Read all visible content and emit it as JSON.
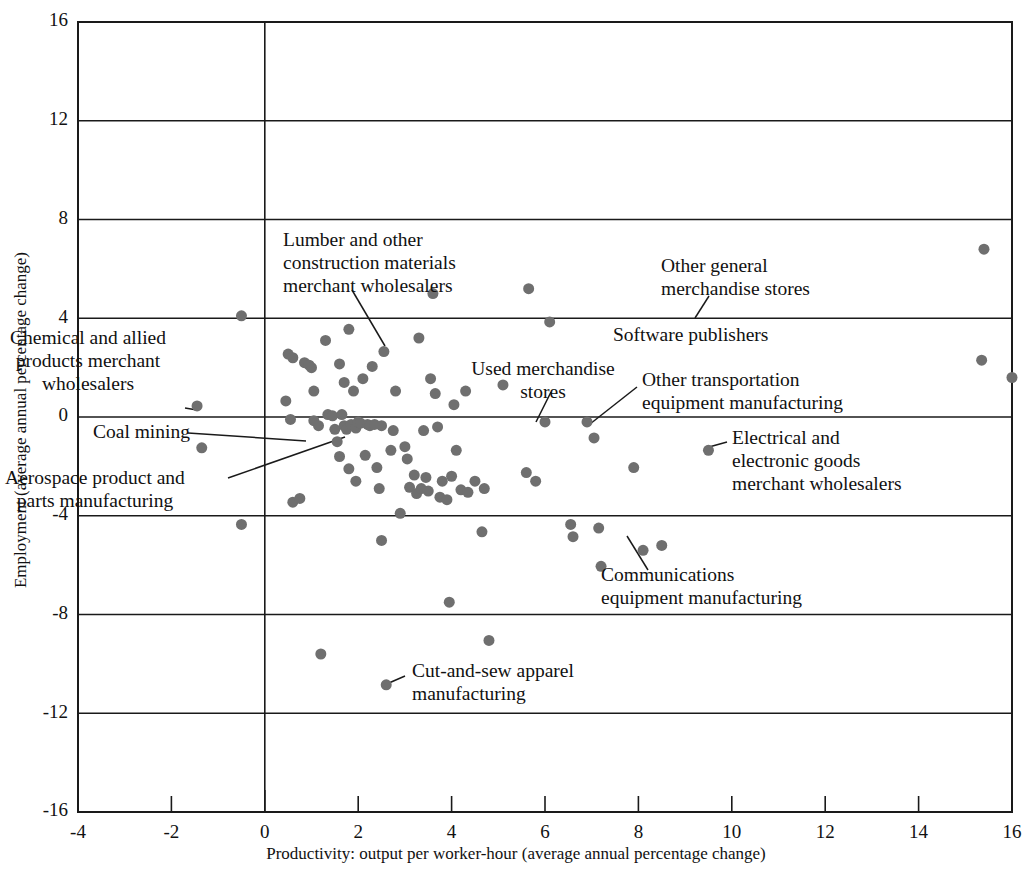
{
  "chart_data": {
    "type": "scatter",
    "title": "",
    "xlabel": "Productivity: output per worker-hour (average annual percentage change)",
    "ylabel": "Employment (average annual percentage change)",
    "xlim": [
      -4,
      16
    ],
    "ylim": [
      -16,
      16
    ],
    "xticks": [
      -4,
      -2,
      0,
      2,
      4,
      6,
      8,
      10,
      12,
      14,
      16
    ],
    "xtick_labels": [
      "-4",
      "-2",
      "0",
      "2",
      "4",
      "6",
      "8",
      "10",
      "12",
      "14",
      "16"
    ],
    "yticks": [
      -16,
      -12,
      -8,
      -4,
      0,
      4,
      8,
      12,
      16
    ],
    "ytick_labels": [
      "-16",
      "-12",
      "-8",
      "-4",
      "0",
      "4",
      "8",
      "12",
      "16"
    ],
    "grid": "horizontal gridlines at every y tick; vertical line at x=0",
    "legend": "none",
    "marker": {
      "shape": "circle",
      "color": "#6f6f6f",
      "size": 11
    },
    "points": [
      [
        -0.5,
        4.1
      ],
      [
        -1.45,
        0.45
      ],
      [
        -1.35,
        -1.25
      ],
      [
        -0.5,
        -4.35
      ],
      [
        0.45,
        0.65
      ],
      [
        0.5,
        2.55
      ],
      [
        0.6,
        2.4
      ],
      [
        0.55,
        -0.1
      ],
      [
        0.6,
        -3.45
      ],
      [
        0.75,
        -3.3
      ],
      [
        0.85,
        2.2
      ],
      [
        0.95,
        2.1
      ],
      [
        1.0,
        2.0
      ],
      [
        1.05,
        1.05
      ],
      [
        1.05,
        -0.15
      ],
      [
        1.15,
        -0.35
      ],
      [
        1.2,
        -9.6
      ],
      [
        1.3,
        3.1
      ],
      [
        1.35,
        0.1
      ],
      [
        1.45,
        0.05
      ],
      [
        1.5,
        -0.5
      ],
      [
        1.55,
        -1.0
      ],
      [
        1.6,
        -1.6
      ],
      [
        1.6,
        2.15
      ],
      [
        1.65,
        0.1
      ],
      [
        1.7,
        -0.35
      ],
      [
        1.7,
        1.4
      ],
      [
        1.75,
        -0.5
      ],
      [
        1.8,
        -2.1
      ],
      [
        1.8,
        3.55
      ],
      [
        1.85,
        -0.3
      ],
      [
        1.9,
        1.05
      ],
      [
        1.95,
        -0.45
      ],
      [
        1.95,
        -2.6
      ],
      [
        2.0,
        -0.2
      ],
      [
        2.05,
        -0.25
      ],
      [
        2.1,
        1.55
      ],
      [
        2.15,
        -1.55
      ],
      [
        2.2,
        -0.3
      ],
      [
        2.25,
        -0.35
      ],
      [
        2.3,
        2.05
      ],
      [
        2.35,
        -0.3
      ],
      [
        2.4,
        -2.05
      ],
      [
        2.45,
        -2.9
      ],
      [
        2.5,
        -0.35
      ],
      [
        2.5,
        -5.0
      ],
      [
        2.55,
        2.65
      ],
      [
        2.6,
        -10.85
      ],
      [
        2.7,
        -1.35
      ],
      [
        2.75,
        -0.55
      ],
      [
        2.8,
        1.05
      ],
      [
        2.9,
        -3.9
      ],
      [
        3.0,
        -1.2
      ],
      [
        3.05,
        -1.7
      ],
      [
        3.1,
        -2.85
      ],
      [
        3.2,
        -2.35
      ],
      [
        3.25,
        -3.1
      ],
      [
        3.3,
        3.2
      ],
      [
        3.35,
        -2.9
      ],
      [
        3.4,
        -0.55
      ],
      [
        3.45,
        -2.45
      ],
      [
        3.5,
        -3.0
      ],
      [
        3.55,
        1.55
      ],
      [
        3.6,
        5.0
      ],
      [
        3.65,
        0.95
      ],
      [
        3.7,
        -0.4
      ],
      [
        3.75,
        -3.25
      ],
      [
        3.8,
        -2.6
      ],
      [
        3.9,
        -3.35
      ],
      [
        3.95,
        -7.5
      ],
      [
        4.0,
        -2.4
      ],
      [
        4.05,
        0.5
      ],
      [
        4.1,
        -1.35
      ],
      [
        4.2,
        -2.95
      ],
      [
        4.3,
        1.05
      ],
      [
        4.35,
        -3.05
      ],
      [
        4.5,
        -2.6
      ],
      [
        4.65,
        -4.65
      ],
      [
        4.7,
        -2.9
      ],
      [
        4.8,
        -9.05
      ],
      [
        5.1,
        1.3
      ],
      [
        5.6,
        -2.25
      ],
      [
        5.65,
        5.2
      ],
      [
        5.8,
        -2.6
      ],
      [
        6.0,
        -0.2
      ],
      [
        6.1,
        3.85
      ],
      [
        6.55,
        -4.35
      ],
      [
        6.6,
        -4.85
      ],
      [
        6.9,
        -0.2
      ],
      [
        7.05,
        -0.85
      ],
      [
        7.15,
        -4.5
      ],
      [
        7.2,
        -6.05
      ],
      [
        7.9,
        -2.05
      ],
      [
        8.1,
        -5.4
      ],
      [
        8.5,
        -5.2
      ],
      [
        9.5,
        -1.35
      ],
      [
        15.4,
        6.8
      ],
      [
        15.35,
        2.3
      ],
      [
        16.0,
        1.6
      ]
    ],
    "annotations": [
      {
        "id": "chemical-allied-products",
        "text": [
          "Chemical and allied",
          "products merchant",
          "wholesalers"
        ],
        "text_anchor_px": [
          88,
          340
        ],
        "line_from_px": [
          185,
          408
        ],
        "line_to_px": [
          197,
          410
        ],
        "point": [
          -1.45,
          0.45
        ],
        "align": "center"
      },
      {
        "id": "coal-mining",
        "text": [
          "Coal mining"
        ],
        "text_anchor_px": [
          93,
          434
        ],
        "line_from_px": [
          188,
          433
        ],
        "line_to_px": [
          306,
          441
        ],
        "point": [
          0.9,
          -0.35
        ],
        "align": "left"
      },
      {
        "id": "aerospace-product-parts",
        "text": [
          "Aerospace product and",
          "parts manufacturing"
        ],
        "text_anchor_px": [
          95,
          480
        ],
        "line_from_px": [
          228,
          478
        ],
        "line_to_px": [
          345,
          437
        ],
        "point": [
          1.7,
          -0.3
        ],
        "align": "center"
      },
      {
        "id": "lumber-construction-materials",
        "text": [
          "Lumber and other",
          "construction materials",
          "merchant wholesalers"
        ],
        "text_anchor_px": [
          283,
          242
        ],
        "line_from_px": [
          352,
          290
        ],
        "line_to_px": [
          385,
          346
        ],
        "point": [
          2.55,
          2.65
        ],
        "align": "left"
      },
      {
        "id": "other-general-merchandise-stores",
        "text": [
          "Other general",
          "merchandise stores"
        ],
        "text_anchor_px": [
          661,
          268
        ],
        "line_from_px": [
          709,
          296
        ],
        "line_to_px": [
          695,
          318
        ],
        "point": [
          6.1,
          3.85
        ],
        "align": "left"
      },
      {
        "id": "software-publishers",
        "text": [
          "Software publishers"
        ],
        "text_anchor_px": [
          613,
          337
        ],
        "line_from_px": null,
        "line_to_px": null,
        "point": [
          5.65,
          2.6
        ],
        "align": "left"
      },
      {
        "id": "used-merchandise-stores",
        "text": [
          "Used merchandise",
          "stores"
        ],
        "text_anchor_px": [
          543,
          371
        ],
        "line_from_px": [
          551,
          392
        ],
        "line_to_px": [
          536,
          422
        ],
        "point": [
          6.0,
          -0.2
        ],
        "align": "center"
      },
      {
        "id": "other-transportation-equipment",
        "text": [
          "Other transportation",
          "equipment manufacturing"
        ],
        "text_anchor_px": [
          642,
          382
        ],
        "line_from_px": [
          637,
          387
        ],
        "line_to_px": [
          590,
          424
        ],
        "point": [
          6.9,
          -0.2
        ],
        "align": "left"
      },
      {
        "id": "electrical-electronic-goods",
        "text": [
          "Electrical and",
          "electronic goods",
          "merchant wholesalers"
        ],
        "text_anchor_px": [
          732,
          440
        ],
        "line_from_px": [
          727,
          442
        ],
        "line_to_px": [
          709,
          447
        ],
        "point": [
          9.5,
          -1.35
        ],
        "align": "left"
      },
      {
        "id": "communications-equipment",
        "text": [
          "Communications",
          "equipment manufacturing"
        ],
        "text_anchor_px": [
          601,
          577
        ],
        "line_from_px": [
          648,
          570
        ],
        "line_to_px": [
          627,
          536
        ],
        "point": [
          8.1,
          -5.4
        ],
        "align": "left"
      },
      {
        "id": "cut-and-sew-apparel",
        "text": [
          "Cut-and-sew apparel",
          "manufacturing"
        ],
        "text_anchor_px": [
          412,
          673
        ],
        "line_from_px": [
          405,
          676
        ],
        "line_to_px": [
          382,
          686
        ],
        "point": [
          2.6,
          -10.85
        ],
        "align": "left"
      }
    ]
  },
  "plot_geometry": {
    "left_px": 78,
    "right_px": 1012,
    "top_px": 22,
    "bottom_px": 812
  }
}
